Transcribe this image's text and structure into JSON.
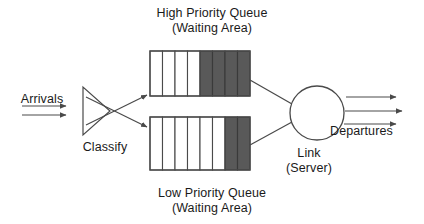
{
  "diagram": {
    "type": "block-flow-diagram",
    "background_color": "#ffffff",
    "stroke_color": "#4a4a4a",
    "text_color": "#1a1a1a",
    "cell_empty_color": "#ffffff",
    "cell_filled_color": "#595959"
  },
  "labels": {
    "high_queue_line1": "High Priority Queue",
    "high_queue_line2": "(Waiting Area)",
    "low_queue_line1": "Low Priority Queue",
    "low_queue_line2": "(Waiting Area)",
    "arrivals": "Arrivals",
    "classify": "Classify",
    "link_line1": "Link",
    "link_line2": "(Server)",
    "departures": "Departures"
  },
  "queues": [
    {
      "name": "high-priority-queue",
      "label": "High Priority Queue (Waiting Area)",
      "total_cells": 8,
      "filled_cells": 4,
      "empty_cells": 4,
      "fill_from": "right"
    },
    {
      "name": "low-priority-queue",
      "label": "Low Priority Queue (Waiting Area)",
      "total_cells": 8,
      "filled_cells": 2,
      "empty_cells": 6,
      "fill_from": "right"
    }
  ],
  "flows": {
    "arrival_arrows": 2,
    "departure_arrows": 3,
    "classify_to_high_queue": 1,
    "classify_to_low_queue": 1,
    "high_queue_to_link": 1,
    "low_queue_to_link": 1
  },
  "nodes": [
    {
      "name": "classifier",
      "shape": "triangle",
      "label": "Classify"
    },
    {
      "name": "server",
      "shape": "circle",
      "label": "Link (Server)"
    }
  ]
}
